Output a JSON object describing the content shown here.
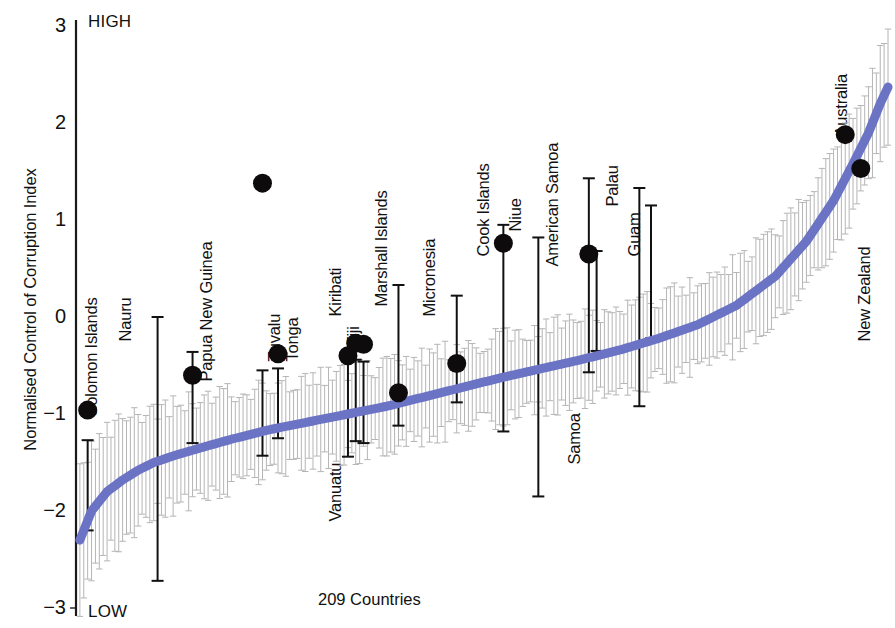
{
  "figure": {
    "y_axis_title": "Normalised Control of Corruption Index",
    "x_axis_title": "209 Countries",
    "high_label": "HIGH",
    "low_label": "LOW",
    "line_color": "#6a73c4",
    "errorbar_color": "#b5b5b5",
    "highlight_color": "#111111",
    "marker_color": "#0d0b0b"
  },
  "chart_data": {
    "type": "scatter",
    "title": "",
    "subtitle": "",
    "xlabel": "209 Countries",
    "ylabel": "Normalised Control of Corruption Index",
    "xlim": [
      0,
      209
    ],
    "ylim": [
      -3,
      3
    ],
    "yticks": [
      3,
      2,
      1,
      0,
      -1,
      -2,
      -3
    ],
    "ytick_labels": [
      "3",
      "2",
      "1",
      "0",
      "-1",
      "-2",
      "-3"
    ],
    "grid": false,
    "legend": "none",
    "annotations": [
      "HIGH",
      "LOW"
    ],
    "series": [
      {
        "name": "All 209 countries (ranked estimate)",
        "type": "line",
        "color": "#6a73c4",
        "description": "Monotonically increasing ranked Control of Corruption estimate for 209 countries, from about -2.3 at rank 1 to about +2.37 at rank 209",
        "x": [
          1,
          4,
          8,
          12,
          16,
          20,
          26,
          32,
          40,
          50,
          60,
          70,
          80,
          90,
          100,
          110,
          120,
          130,
          140,
          150,
          160,
          170,
          180,
          188,
          195,
          200,
          204,
          207,
          209
        ],
        "y": [
          -2.3,
          -2.0,
          -1.8,
          -1.68,
          -1.58,
          -1.5,
          -1.42,
          -1.35,
          -1.26,
          -1.16,
          -1.08,
          -1.0,
          -0.92,
          -0.82,
          -0.72,
          -0.62,
          -0.53,
          -0.44,
          -0.34,
          -0.22,
          -0.08,
          0.12,
          0.42,
          0.78,
          1.2,
          1.58,
          1.9,
          2.2,
          2.37
        ]
      },
      {
        "name": "Pacific island countries (highlighted)",
        "type": "scatter-with-error",
        "color": "#111111",
        "points": [
          {
            "label": "Solomon Islands",
            "rank": 3,
            "value": -0.96,
            "ci_low": -2.2,
            "ci_high": -1.27
          },
          {
            "label": "Nauru",
            "rank": 21,
            "value": null,
            "ci_low": -2.72,
            "ci_high": 0.0
          },
          {
            "label": "Papua New Guinea",
            "rank": 30,
            "value": -0.6,
            "ci_low": -1.3,
            "ci_high": -0.36
          },
          {
            "label": "Tuvalu",
            "rank": 48,
            "value": 1.38,
            "ci_low": -1.43,
            "ci_high": -0.55
          },
          {
            "label": "Tonga",
            "rank": 52,
            "value": -0.38,
            "ci_low": -1.25,
            "ci_high": -0.53
          },
          {
            "label": "Vanuatu",
            "rank": 70,
            "value": -0.4,
            "ci_low": -1.44,
            "ci_high": -0.46
          },
          {
            "label": "Kiribati",
            "rank": 72,
            "value": -0.27,
            "ci_low": -1.28,
            "ci_high": -0.44
          },
          {
            "label": "Fiji",
            "rank": 74,
            "value": -0.28,
            "ci_low": -1.3,
            "ci_high": -0.46
          },
          {
            "label": "Marshall Islands",
            "rank": 83,
            "value": -0.78,
            "ci_low": -1.12,
            "ci_high": 0.33
          },
          {
            "label": "Micronesia",
            "rank": 98,
            "value": -0.48,
            "ci_low": -0.88,
            "ci_high": 0.22
          },
          {
            "label": "Cook Islands",
            "rank": 110,
            "value": 0.76,
            "ci_low": -1.18,
            "ci_high": 0.95
          },
          {
            "label": "Niue",
            "rank": 119,
            "value": null,
            "ci_low": -1.85,
            "ci_high": 0.82
          },
          {
            "label": "American Samoa",
            "rank": 132,
            "value": 0.65,
            "ci_low": -0.57,
            "ci_high": 1.43
          },
          {
            "label": "Samoa",
            "rank": 134,
            "value": null,
            "ci_low": -0.35,
            "ci_high": 0.68
          },
          {
            "label": "Palau",
            "rank": 145,
            "value": null,
            "ci_low": -0.92,
            "ci_high": 1.33
          },
          {
            "label": "Guam",
            "rank": 148,
            "value": null,
            "ci_low": -0.22,
            "ci_high": 1.15
          },
          {
            "label": "Australia",
            "rank": 198,
            "value": 1.88,
            "ci_low": null,
            "ci_high": null
          },
          {
            "label": "New Zealand",
            "rank": 202,
            "value": 1.53,
            "ci_low": null,
            "ci_high": null
          }
        ]
      }
    ]
  },
  "labels": [
    {
      "text": "Solomon Islands"
    },
    {
      "text": "Nauru"
    },
    {
      "text": "Papua New Guinea"
    },
    {
      "text": "Tuvalu"
    },
    {
      "text": "Tonga"
    },
    {
      "text": "Vanuatu"
    },
    {
      "text": "Kiribati"
    },
    {
      "text": "Fiji"
    },
    {
      "text": "Marshall Islands"
    },
    {
      "text": "Micronesia"
    },
    {
      "text": "Cook Islands"
    },
    {
      "text": "Niue"
    },
    {
      "text": "American Samoa"
    },
    {
      "text": "Samoa"
    },
    {
      "text": "Palau"
    },
    {
      "text": "Guam"
    },
    {
      "text": "Australia"
    },
    {
      "text": "New Zealand"
    }
  ]
}
